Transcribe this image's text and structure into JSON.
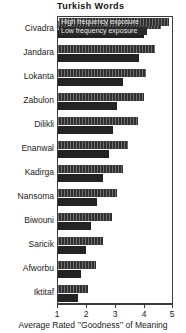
{
  "chart_data": {
    "type": "bar",
    "orientation": "horizontal",
    "grouped": true,
    "title": "Turkish Words",
    "xlabel": "Average Rated ’’Goodness’’ of Meaning",
    "ylabel": "",
    "xlim": [
      1,
      5
    ],
    "xticks": [
      1,
      2,
      3,
      4,
      5
    ],
    "xticklabels": [
      "1",
      "2",
      "3",
      "4",
      "5"
    ],
    "grid": false,
    "legend_position": "top-left-inside",
    "categories": [
      "Civadra",
      "Jandara",
      "Lokanta",
      "Zabulon",
      "Dilikli",
      "Enanwal",
      "Kadirga",
      "Nansoma",
      "Biwouni",
      "Saricik",
      "Afworbu",
      "Iktitaf"
    ],
    "series": [
      {
        "name": "High frequency exposure",
        "color": "#2f2f2f",
        "values": [
          4.55,
          4.35,
          4.05,
          3.95,
          3.75,
          3.4,
          3.25,
          3.05,
          2.85,
          2.55,
          2.3,
          2.05
        ]
      },
      {
        "name": "Low frequency exposure",
        "color": "#232323",
        "values": [
          3.95,
          3.8,
          3.25,
          3.05,
          2.9,
          2.75,
          2.55,
          2.35,
          2.15,
          1.95,
          1.8,
          1.7
        ]
      }
    ]
  }
}
